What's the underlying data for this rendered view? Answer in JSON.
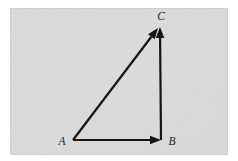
{
  "figure": {
    "kind": "vector-triangle-diagram",
    "canvas": {
      "width": 238,
      "height": 161,
      "page_background": "#ffffff"
    },
    "panel": {
      "name": "figure-panel",
      "x": 10,
      "y": 8,
      "width": 218,
      "height": 147,
      "fill": "#dcdcdc",
      "texture": "speckled-gray-scan-noise"
    },
    "stroke_color": "#141414",
    "stroke_width": 2.2,
    "vertices": [
      {
        "id": "A",
        "label": "A",
        "x": 73,
        "y": 140,
        "label_x": 62,
        "label_y": 145
      },
      {
        "id": "B",
        "label": "B",
        "x": 161,
        "y": 140,
        "label_x": 172,
        "label_y": 145
      },
      {
        "id": "C",
        "label": "C",
        "x": 160,
        "y": 27,
        "label_x": 161,
        "label_y": 20
      }
    ],
    "vectors": [
      {
        "id": "AB",
        "name": "vector-a-to-b",
        "from": "A",
        "to": "B",
        "x1": 73,
        "y1": 140,
        "x2": 161,
        "y2": 140,
        "arrowhead": "at-end",
        "orientation": "horizontal"
      },
      {
        "id": "BC",
        "name": "vector-b-to-c",
        "from": "B",
        "to": "C",
        "x1": 161,
        "y1": 140,
        "x2": 160,
        "y2": 27,
        "arrowhead": "at-end",
        "orientation": "vertical"
      },
      {
        "id": "AC",
        "name": "vector-a-to-c",
        "from": "A",
        "to": "C",
        "x1": 73,
        "y1": 140,
        "x2": 158,
        "y2": 28,
        "arrowhead": "at-end",
        "orientation": "diagonal"
      }
    ],
    "arrowhead": {
      "length": 11,
      "half_width": 4.2,
      "style": "solid-filled-triangle"
    }
  }
}
